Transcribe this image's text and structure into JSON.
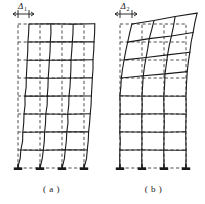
{
  "figure": {
    "kind": "structural-deformation-comparison",
    "background": "#ffffff",
    "ink_color": "#1a1a1a",
    "undeformed_color": "#3a3a3a",
    "panels": [
      {
        "id": "a",
        "caption": "( a )",
        "mode_name": "shear deformation mode",
        "drift_label": "Δ",
        "drift_subscript": "1",
        "origin_x": 18,
        "base_y": 168,
        "bays": 3,
        "bay_width": 22,
        "stories": 8,
        "story_height": 18,
        "top_drift_px": 11,
        "support_count": 4,
        "support_type": "fixed-base-plate",
        "deformed_profile_note": "columns bow continuously, largest slope near base",
        "shape_exponent": 0.62
      },
      {
        "id": "b",
        "caption": "( b )",
        "mode_name": "flexural deformation mode",
        "drift_label": "Δ",
        "drift_subscript": "2",
        "origin_x": 120,
        "base_y": 168,
        "bays": 3,
        "bay_width": 22,
        "stories": 8,
        "story_height": 18,
        "top_drift_px": 12,
        "support_count": 4,
        "support_type": "fixed-base-plate",
        "rigid_lower_stories": 4,
        "deformed_profile_note": "upper stories rotate as rigid blocks, lower stories undeformed",
        "shape_exponent": 2.1,
        "block_rotation_deg": 9.5
      }
    ],
    "legend_note": {
      "dashed": "undeformed frame",
      "solid": "deformed frame"
    },
    "dimension_marker": {
      "tick_half_height": 4,
      "arrow_size": 3
    }
  }
}
